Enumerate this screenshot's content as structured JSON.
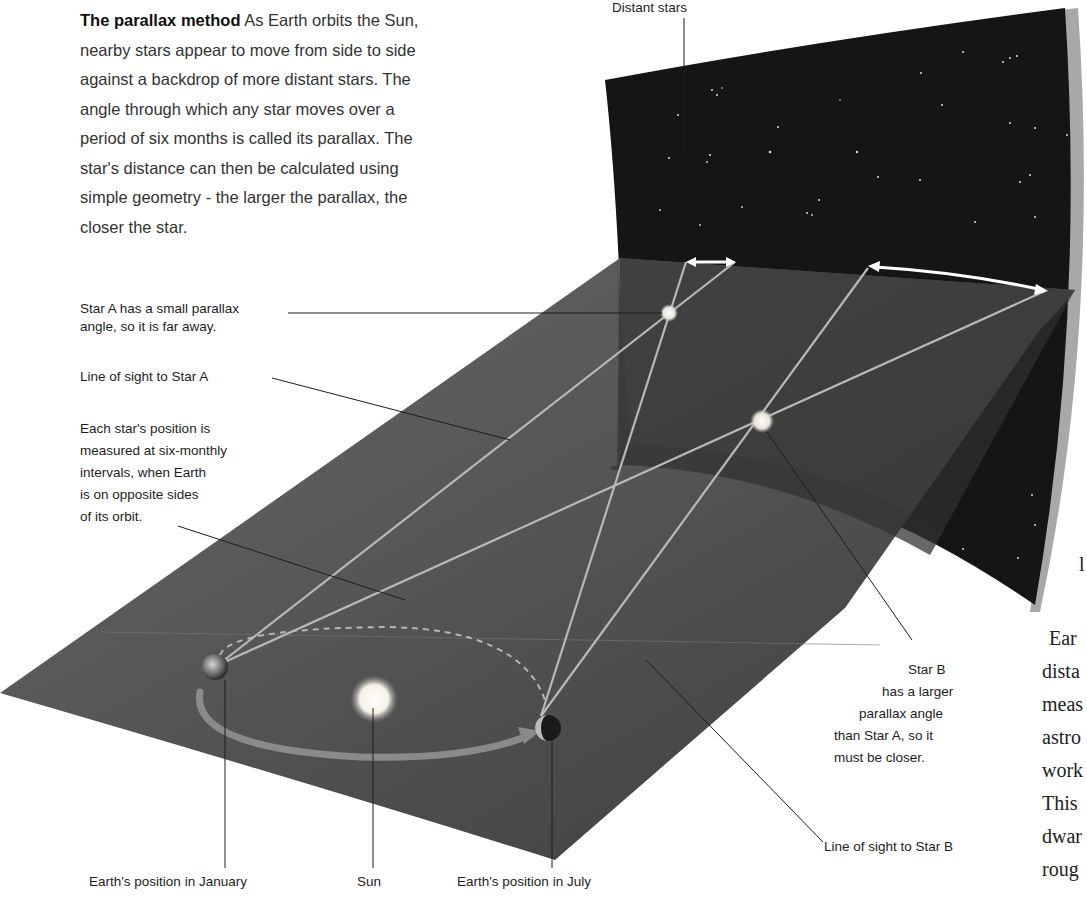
{
  "intro": {
    "title": "The parallax method",
    "body": "As Earth orbits the Sun, nearby stars appear to move from side to side against a backdrop of more distant stars. The angle through which any star moves over a period of six months is called its parallax. The star's distance can then be calculated using simple geometry - the larger the parallax, the closer the star."
  },
  "labels": {
    "distant_stars": "Distant stars",
    "star_a_line1": "Star A has a small parallax",
    "star_a_line2": "angle, so it is far away.",
    "line_of_sight_a": "Line of sight to Star A",
    "measured_1": "Each star's position is",
    "measured_2": "measured at six-monthly",
    "measured_3": "intervals, when Earth",
    "measured_4": "is on opposite sides",
    "measured_5": "of its orbit.",
    "star_b_1": "Star B",
    "star_b_2": "has a larger",
    "star_b_3": "parallax angle",
    "star_b_4": "than Star A, so it",
    "star_b_5": "must be closer.",
    "line_of_sight_b": "Line of sight to Star B",
    "earth_january": "Earth's position in January",
    "sun": "Sun",
    "earth_july": "Earth's position in July"
  },
  "cropped_text": {
    "l": "l",
    "lines": [
      "Ear",
      "dista",
      "meas",
      "astro",
      "work",
      "This",
      "dwar",
      "roug"
    ]
  },
  "colors": {
    "sky": "#141414",
    "plane": "#4a4a4a",
    "backdrop_plane": "#3a3a3a",
    "sight_lines": "#b8b8b8",
    "arrows": "#ffffff"
  }
}
